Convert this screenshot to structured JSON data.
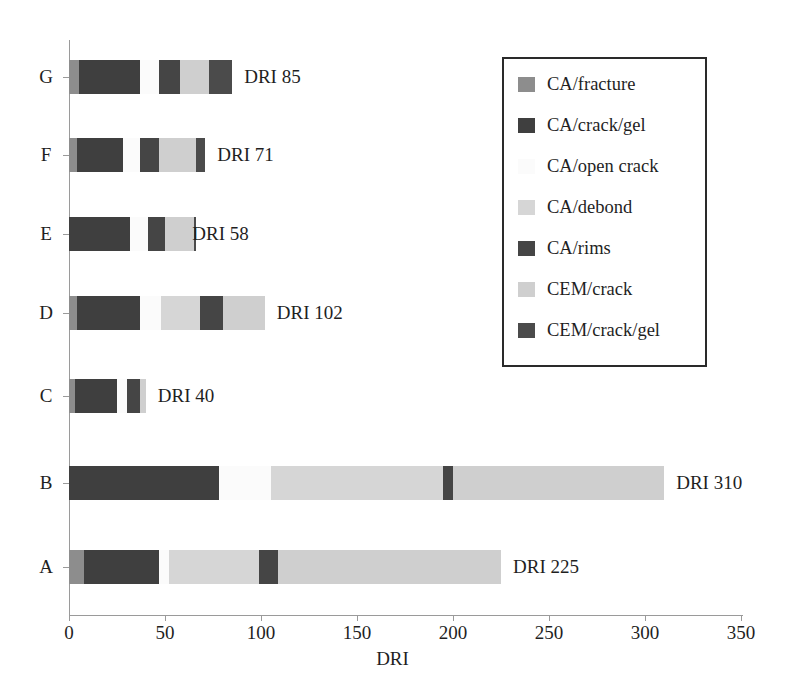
{
  "chart_data": {
    "type": "bar",
    "orientation": "horizontal",
    "stacked": true,
    "title": "",
    "xlabel": "DRI",
    "ylabel": "",
    "xlim": [
      0,
      350
    ],
    "ylim": null,
    "grid": false,
    "legend_position": "upper right",
    "xticks": [
      0,
      50,
      100,
      150,
      200,
      250,
      300,
      350
    ],
    "xtick_labels": [
      "0",
      "50",
      "100",
      "150",
      "200",
      "250",
      "300",
      "350"
    ],
    "categories": [
      "A",
      "B",
      "C",
      "D",
      "E",
      "F",
      "G"
    ],
    "category_order_top_to_bottom": [
      "G",
      "F",
      "E",
      "D",
      "C",
      "B",
      "A"
    ],
    "totals": {
      "A": 225,
      "B": 310,
      "C": 40,
      "D": 102,
      "E": 58,
      "F": 71,
      "G": 85
    },
    "data_labels": {
      "A": "DRI 225",
      "B": "DRI 310",
      "C": "DRI 40",
      "D": "DRI 102",
      "E": "DRI 58",
      "F": "DRI 71",
      "G": "DRI 85"
    },
    "series": [
      {
        "name": "CA/fracture",
        "color": "#8d8d8d",
        "values": {
          "A": 8,
          "B": 0,
          "C": 3,
          "D": 4,
          "E": 0,
          "F": 4,
          "G": 5
        }
      },
      {
        "name": "CA/crack/gel",
        "color": "#3f3f3f",
        "values": {
          "A": 39,
          "B": 78,
          "C": 22,
          "D": 33,
          "E": 32,
          "F": 24,
          "G": 32
        }
      },
      {
        "name": "CA/open crack",
        "color": "#fbfbfb",
        "values": {
          "A": 5,
          "B": 27,
          "C": 5,
          "D": 11,
          "E": 9,
          "F": 9,
          "G": 10
        }
      },
      {
        "name": "CA/debond",
        "color": "#d6d6d6",
        "values": {
          "A": 47,
          "B": 90,
          "C": 0,
          "D": 20,
          "E": 0,
          "F": 0,
          "G": 0
        }
      },
      {
        "name": "CA/rims",
        "color": "#454545",
        "values": {
          "A": 10,
          "B": 5,
          "C": 7,
          "D": 12,
          "E": 9,
          "F": 10,
          "G": 11
        }
      },
      {
        "name": "CEM/crack",
        "color": "#cfcfcf",
        "values": {
          "A": 116,
          "B": 110,
          "C": 3,
          "D": 22,
          "E": 15,
          "F": 19,
          "G": 15
        }
      },
      {
        "name": "CEM/crack/gel",
        "color": "#4b4b4b",
        "values": {
          "A": 0,
          "B": 0,
          "C": 0,
          "D": 0,
          "E": 1,
          "F": 5,
          "G": 12
        }
      }
    ],
    "stack_order": [
      "CA/fracture",
      "CA/crack/gel",
      "CA/open crack",
      "CA/debond",
      "CA/rims",
      "CEM/crack",
      "CEM/crack/gel"
    ]
  },
  "legend": {
    "items": [
      {
        "label": "CA/fracture",
        "color": "#8d8d8d"
      },
      {
        "label": "CA/crack/gel",
        "color": "#3f3f3f"
      },
      {
        "label": "CA/open crack",
        "color": "#fbfbfb"
      },
      {
        "label": "CA/debond",
        "color": "#d6d6d6"
      },
      {
        "label": "CA/rims",
        "color": "#454545"
      },
      {
        "label": "CEM/crack",
        "color": "#cfcfcf"
      },
      {
        "label": "CEM/crack/gel",
        "color": "#4b4b4b"
      }
    ]
  },
  "axes": {
    "x_title": "DRI",
    "x_tick_labels": [
      "0",
      "50",
      "100",
      "150",
      "200",
      "250",
      "300",
      "350"
    ],
    "y_tick_labels": [
      "G",
      "F",
      "E",
      "D",
      "C",
      "B",
      "A"
    ]
  }
}
